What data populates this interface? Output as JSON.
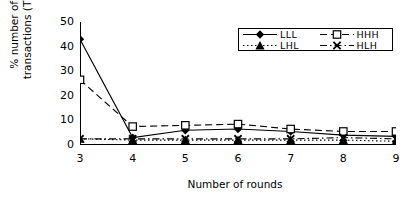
{
  "chart_data": {
    "type": "line",
    "title": "",
    "xlabel": "Number of rounds",
    "ylabel": "% number of transactions (TP)",
    "x": [
      3,
      4,
      5,
      6,
      7,
      8,
      9
    ],
    "xtick_labels": [
      "3",
      "4",
      "5",
      "6",
      "7",
      "8",
      "9"
    ],
    "ytick_labels": [
      "0",
      "10",
      "20",
      "30",
      "40",
      "50"
    ],
    "ytick_values": [
      0,
      10,
      20,
      30,
      40,
      50
    ],
    "xlim": [
      3,
      9
    ],
    "ylim": [
      0,
      50
    ],
    "grid": false,
    "legend_position": "top-right",
    "series": [
      {
        "name": "LLL",
        "marker": "filled-diamond",
        "line_style": "solid",
        "color": "#000000",
        "values": [
          43,
          3,
          6,
          6.5,
          5.5,
          4,
          3.5
        ]
      },
      {
        "name": "HHH",
        "marker": "open-square",
        "line_style": "dashed",
        "color": "#000000",
        "values": [
          26.5,
          7.5,
          8,
          8.5,
          6.5,
          5.5,
          5.5
        ]
      },
      {
        "name": "LHL",
        "marker": "filled-triangle",
        "line_style": "dotted",
        "color": "#000000",
        "values": [
          2.5,
          2,
          2,
          2,
          2,
          2,
          1.5
        ]
      },
      {
        "name": "HLH",
        "marker": "cross-x",
        "line_style": "dash-dot",
        "color": "#000000",
        "values": [
          2.5,
          2.5,
          2.5,
          2.5,
          2.5,
          3,
          2.5
        ]
      }
    ]
  }
}
